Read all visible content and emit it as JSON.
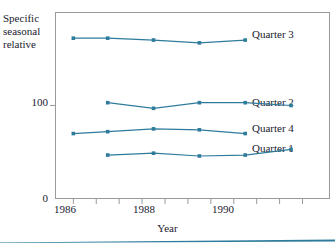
{
  "chart_data": {
    "type": "line",
    "title": "",
    "xlabel": "Year",
    "ylabel": "Specific seasonal relative",
    "ylabel_lines": [
      "Specific",
      "seasonal",
      "relative"
    ],
    "x": [
      1986.25,
      1986.75,
      1987.75,
      1988.75,
      1989.75,
      1990.75
    ],
    "xlim": [
      1985.6,
      1991.6
    ],
    "ylim": [
      0,
      200
    ],
    "xticks": [
      1986,
      1986.5,
      1987,
      1987.5,
      1988,
      1988.5,
      1989,
      1989.5,
      1990,
      1990.5,
      1991
    ],
    "xtick_labels": [
      "1986",
      "",
      "",
      "",
      "1988",
      "",
      "",
      "",
      "1990",
      "",
      ""
    ],
    "yticks": [
      0,
      100
    ],
    "ytick_labels": [
      "0",
      "100"
    ],
    "grid": false,
    "legend_position": "right-inline",
    "line_color": "#2E7B9C",
    "marker": "square",
    "series": [
      {
        "name": "Quarter 3",
        "label": "Quarter 3",
        "x": [
          1986.0,
          1986.75,
          1987.75,
          1988.75,
          1989.75
        ],
        "values": [
          172,
          172,
          170,
          167,
          170
        ]
      },
      {
        "name": "Quarter 2",
        "label": "Quarter 2",
        "x": [
          1986.75,
          1987.75,
          1988.75,
          1989.75,
          1990.75
        ],
        "values": [
          103,
          97,
          103,
          103,
          100
        ]
      },
      {
        "name": "Quarter 4",
        "label": "Quarter 4",
        "x": [
          1986.0,
          1986.75,
          1987.75,
          1988.75,
          1989.75
        ],
        "values": [
          70,
          72,
          75,
          74,
          70
        ]
      },
      {
        "name": "Quarter 1",
        "label": "Quarter 1",
        "x": [
          1986.75,
          1987.75,
          1988.75,
          1989.75,
          1990.75
        ],
        "values": [
          47,
          49,
          46,
          47,
          53
        ]
      }
    ]
  },
  "axes": {
    "ylabel_line1": "Specific",
    "ylabel_line2": "seasonal",
    "ylabel_line3": "relative",
    "xlabel": "Year",
    "ytick_100": "100",
    "ytick_0": "0",
    "xtick_1986": "1986",
    "xtick_1988": "1988",
    "xtick_1990": "1990"
  },
  "labels": {
    "quarter3": "Quarter 3",
    "quarter2": "Quarter 2",
    "quarter4": "Quarter 4",
    "quarter1": "Quarter 1"
  },
  "colors": {
    "series": "#2E7B9C",
    "frame": "#9a9a9a",
    "text": "#1a1a2e",
    "rule": "#2E7B9C"
  }
}
